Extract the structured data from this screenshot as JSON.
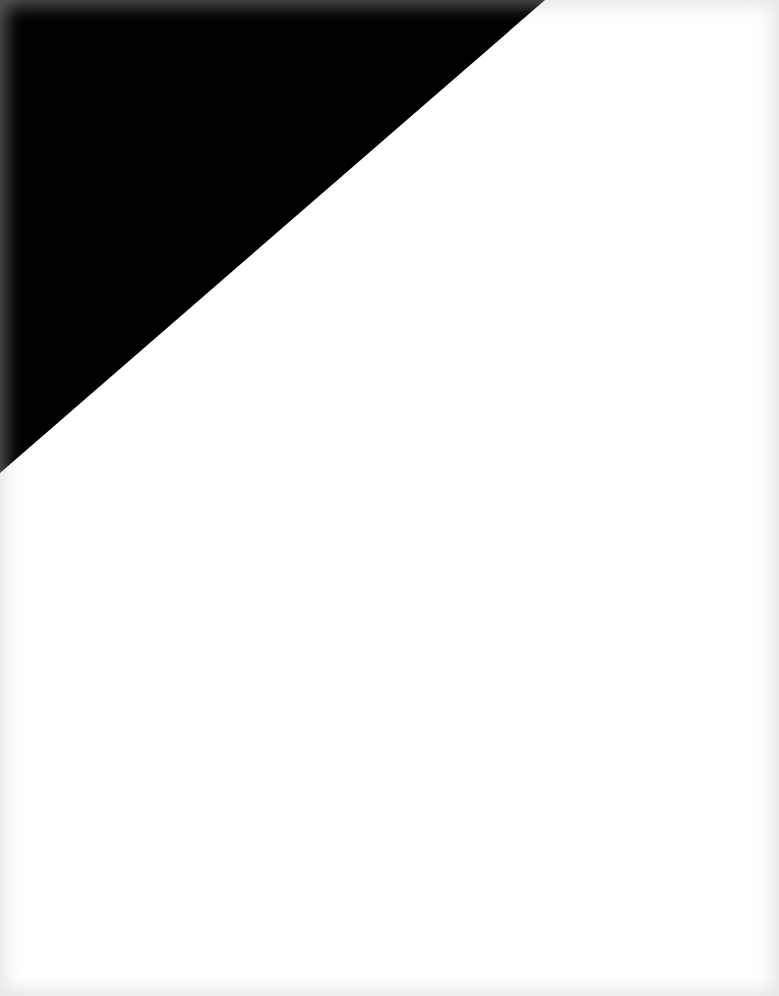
{
  "canvas": {
    "width": 779,
    "height": 996,
    "background_color": "#ffffff",
    "edge_shade_color": "#e6e6e6"
  },
  "shapes": [
    {
      "type": "triangle",
      "fill": "#000000",
      "points": "0,0 545,0 0,473"
    }
  ]
}
